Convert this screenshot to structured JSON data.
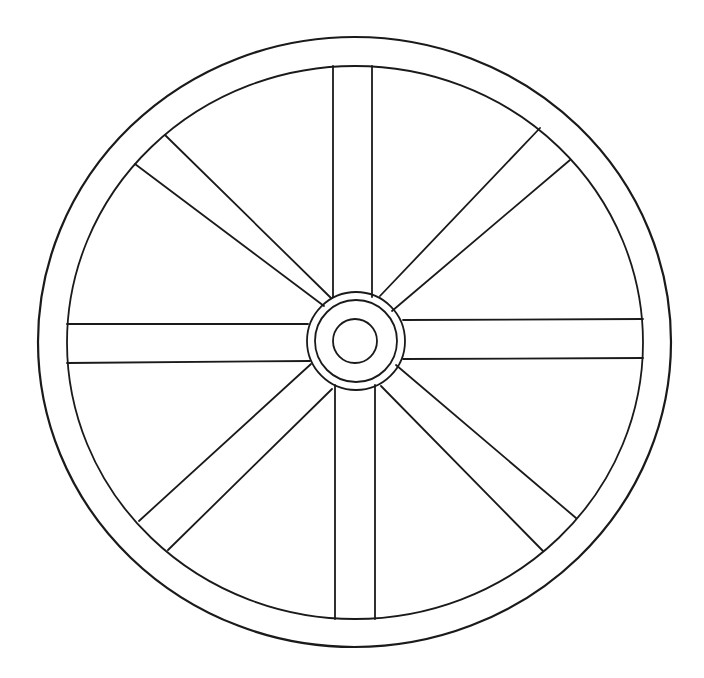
{
  "diagram": {
    "background": "#ffffff",
    "line_color": "#1a1a1a",
    "rim": {
      "outer": {
        "cx": 354.5,
        "cy": 342,
        "rx": 316.5,
        "ry": 305
      },
      "inner": {
        "cx": 355,
        "cy": 342.5,
        "rx": 288,
        "ry": 276.5
      }
    },
    "hub": {
      "outer": {
        "cx": 356,
        "cy": 341,
        "r": 49
      },
      "middle": {
        "cx": 356,
        "cy": 341,
        "r": 41
      },
      "inner": {
        "cx": 355,
        "cy": 341,
        "r": 22
      }
    },
    "spokes": [
      {
        "name": "spoke-top",
        "lines": [
          [
            333,
            66,
            333,
            297
          ],
          [
            372,
            66,
            372,
            297
          ]
        ]
      },
      {
        "name": "spoke-bottom",
        "lines": [
          [
            335,
            385,
            335,
            619
          ],
          [
            375,
            385,
            375,
            619
          ]
        ]
      },
      {
        "name": "spoke-left",
        "lines": [
          [
            67,
            324,
            308,
            324
          ],
          [
            67,
            363,
            310,
            361
          ]
        ]
      },
      {
        "name": "spoke-right",
        "lines": [
          [
            403,
            320,
            643,
            319
          ],
          [
            403,
            359,
            643,
            358
          ]
        ]
      },
      {
        "name": "spoke-upper-left",
        "lines": [
          [
            135,
            164,
            324,
            306
          ],
          [
            165,
            135,
            331,
            298
          ]
        ]
      },
      {
        "name": "spoke-upper-right",
        "lines": [
          [
            540,
            128,
            380,
            296
          ],
          [
            570,
            160,
            392,
            311
          ]
        ]
      },
      {
        "name": "spoke-lower-left",
        "lines": [
          [
            139,
            521,
            311,
            364
          ],
          [
            168,
            550,
            332,
            389
          ]
        ]
      },
      {
        "name": "spoke-lower-right",
        "lines": [
          [
            576,
            518,
            396,
            365
          ],
          [
            543,
            551,
            381,
            386
          ]
        ]
      }
    ]
  }
}
